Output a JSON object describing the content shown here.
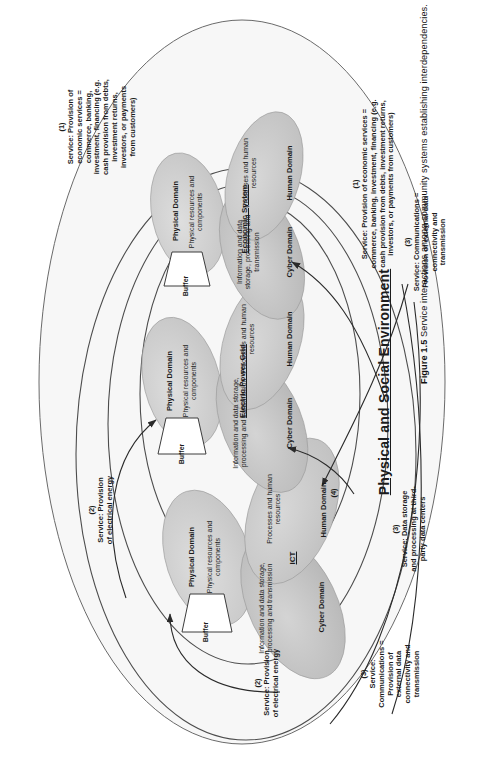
{
  "figure": {
    "number": "Figure 1.5",
    "caption": "Service interactions among community systems establishing interdependencies.",
    "center_title": "Physical and Social Environment"
  },
  "systems": [
    {
      "id": "ict",
      "name": "ICT",
      "domains": {
        "physical": {
          "label": "Physical Domain",
          "content": "Physical resources and components"
        },
        "cyber": {
          "label": "Cyber Domain",
          "content": "Information and data storage, processing and transmission"
        },
        "human": {
          "label": "Human Domain",
          "content": "Processes and human resources"
        }
      },
      "buffer": "Buffer"
    },
    {
      "id": "electric-power-grid",
      "name": "Electric Power Grid",
      "domains": {
        "physical": {
          "label": "Physical Domain",
          "content": "Physical resources and components"
        },
        "cyber": {
          "label": "Cyber Domain",
          "content": "Information and data storage, processing and transmission"
        },
        "human": {
          "label": "Human Domain",
          "content": "Processes and human resources"
        }
      },
      "buffer": "Buffer"
    },
    {
      "id": "economic-system",
      "name": "Economic System",
      "domains": {
        "physical": {
          "label": "Physical Domain",
          "content": "Physical resources and components"
        },
        "cyber": {
          "label": "Cyber Domain",
          "content": "Information and data storage, processing and transmission"
        },
        "human": {
          "label": "Human Domain",
          "content": "Processes and human resources"
        }
      },
      "buffer": "Buffer"
    }
  ],
  "services": [
    {
      "number": "(1)",
      "text": "Service: Provision of economic services = commerce, banking, investment, financing (e.g. cash provision from debts, investment returns, investors, or payments from customers)"
    },
    {
      "number": "(2)",
      "text": "Service: Provision of electrical energy"
    },
    {
      "number": "(3)",
      "text": "Service: Communications = Provision of external data connectivity and transmission"
    },
    {
      "number": "(3)",
      "text": "Service: Data storage and processing at third-party data centers"
    },
    {
      "number": "(4)",
      "text": ""
    }
  ],
  "service_labels": {
    "s1_top": {
      "number": "(1)",
      "lines": [
        "Service: Provision of",
        "economic services =",
        "commerce, banking,",
        "investment, financing (e.g.",
        "cash provision from debts,",
        "investment returns,",
        "investors, or payments",
        "from customers)"
      ]
    },
    "s1_mid": {
      "number": "(1)",
      "lines": [
        "Service: Provision of economic services =",
        "commerce, banking, investment, financing (e.g.",
        "cash provision from debts, investment returns,",
        "investors, or payments from customers)"
      ]
    },
    "s2_upper": {
      "number": "(2)",
      "lines": [
        "Service: Provision",
        "of electrical energy"
      ]
    },
    "s2_lower": {
      "number": "(2)",
      "lines": [
        "Service: Provision",
        "of electrical energy"
      ]
    },
    "s3_right": {
      "number": "(3)",
      "lines": [
        "Service: Communications =",
        "Provision of external data",
        "connectivity and",
        "transmission"
      ]
    },
    "s3_left": {
      "number": "(3)",
      "lines": [
        "Service:",
        "Communications =",
        "Provision of",
        "external data",
        "connectivity and",
        "transmission"
      ]
    },
    "s3_data": {
      "number": "(3)",
      "lines": [
        "Service: Data storage",
        "and processing at third-",
        "party data centers"
      ]
    },
    "s4": {
      "number": "(4)",
      "lines": []
    }
  },
  "colors": {
    "outline": "#555555",
    "physical_fill": "#cfcfcf",
    "cyber_fill": "#bdbdbd",
    "human_fill": "#c9c9c9",
    "environment_fill": "#f4f4f4",
    "text": "#1a1a1a"
  }
}
